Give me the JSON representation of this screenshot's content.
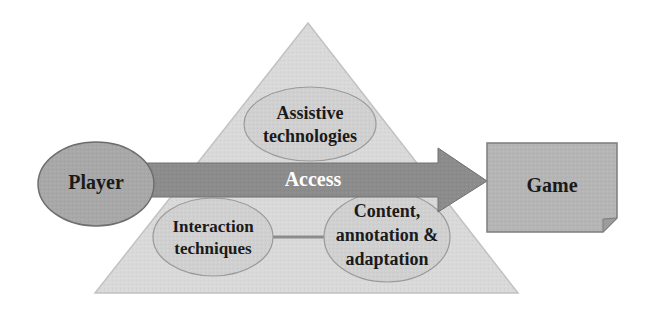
{
  "diagram": {
    "type": "concept-diagram",
    "background": "#ffffff",
    "colors": {
      "triangle_fill": "#d9d9d9",
      "triangle_stroke": "#c4c4c4",
      "ellipse_fill": "#d0d0d0",
      "ellipse_stroke": "#9a9a9a",
      "player_fill": "#a8a8a8",
      "player_stroke": "#6e6e6e",
      "game_fill": "#b5b5b5",
      "game_stroke": "#7d7d7d",
      "arrow_fill": "#8c8c8c",
      "arrow_stroke": "#6e6e6e",
      "connector": "#8c8c8c",
      "text_dark": "#1a1a1a",
      "text_light": "#ffffff"
    },
    "nodes": {
      "player": {
        "label": "Player",
        "shape": "ellipse"
      },
      "game": {
        "label": "Game",
        "shape": "document-box"
      },
      "arrow": {
        "label": "Access",
        "shape": "right-arrow",
        "direction": "left-to-right"
      },
      "pyramid": {
        "shape": "triangle",
        "label": ""
      },
      "assistive": {
        "shape": "ellipse",
        "lines": [
          "Assistive",
          "technologies"
        ]
      },
      "interaction": {
        "shape": "ellipse",
        "lines": [
          "Interaction",
          "techniques"
        ]
      },
      "content": {
        "shape": "ellipse",
        "lines": [
          "Content,",
          "annotation &",
          "adaptation"
        ]
      }
    },
    "edges": [
      {
        "from": "player",
        "to": "game",
        "label": "Access",
        "style": "thick-arrow"
      },
      {
        "from": "interaction",
        "to": "content",
        "label": "",
        "style": "plain-line"
      }
    ]
  }
}
